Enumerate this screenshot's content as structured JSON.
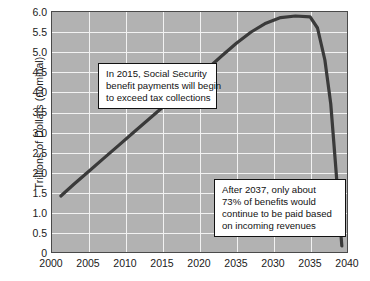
{
  "chart_data": {
    "type": "line",
    "title": "",
    "subtitle": "",
    "xlabel": "",
    "ylabel": "Trillions of Dollars (nominal)",
    "xlim": [
      2000,
      2040
    ],
    "ylim": [
      0,
      6.0
    ],
    "grid": true,
    "legend": "none",
    "x_tick_labels": [
      "2000",
      "2005",
      "2010",
      "2015",
      "2020",
      "2035",
      "2030",
      "2035",
      "2040"
    ],
    "x_tick_values": [
      2000,
      2005,
      2010,
      2015,
      2020,
      2025,
      2030,
      2035,
      2040
    ],
    "y_tick_labels": [
      "6.0",
      "5.5",
      "5.0",
      "4.5",
      "4.0",
      "3.5",
      "3.0",
      "2.5",
      "2.0",
      "1.5",
      "1.0",
      "0.5",
      "0"
    ],
    "y_tick_values": [
      6.0,
      5.5,
      5.0,
      4.5,
      4.0,
      3.5,
      3.0,
      2.5,
      2.0,
      1.5,
      1.0,
      0.5,
      0
    ],
    "series": [
      {
        "name": "Social Security benefit payments (nominal)",
        "color": "#3a3a3a",
        "x": [
          2001.2,
          2003,
          2005,
          2007,
          2009,
          2011,
          2013,
          2015,
          2017,
          2019,
          2021,
          2023,
          2025,
          2027,
          2029,
          2031,
          2033,
          2035,
          2036,
          2037,
          2037.8,
          2038.4,
          2038.9,
          2039.3
        ],
        "y": [
          1.4,
          1.7,
          2.02,
          2.34,
          2.66,
          2.98,
          3.3,
          3.62,
          3.94,
          4.26,
          4.57,
          4.9,
          5.22,
          5.5,
          5.72,
          5.86,
          5.9,
          5.88,
          5.6,
          4.8,
          3.7,
          2.3,
          1.1,
          0.15
        ]
      }
    ],
    "annotations": [
      {
        "id": "callout-2015",
        "lines": [
          "In 2015, Social Security",
          "benefit payments will begin",
          "to exceed tax collections"
        ]
      },
      {
        "id": "callout-2037",
        "lines": [
          "After 2037, only about",
          "73% of benefits would",
          "continue to be paid based",
          "on incoming revenues"
        ]
      }
    ],
    "colors": {
      "plot_background": "#b2b2b2",
      "gridline": "#f2f2f2",
      "axis_border": "#4a4a4a",
      "line": "#3a3a3a",
      "page_background": "#ffffff",
      "text": "#1a1a1a"
    }
  }
}
